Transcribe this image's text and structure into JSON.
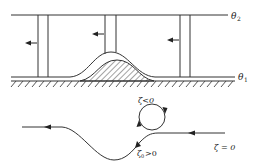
{
  "diagram": {
    "colors": {
      "line": "#333333",
      "background": "#ffffff"
    },
    "isentropes": [
      {
        "id": "theta2",
        "label": "θ",
        "subscript": "2"
      },
      {
        "id": "theta1",
        "label": "θ",
        "subscript": "1"
      }
    ],
    "flow_direction": "right-to-left",
    "trajectory_labels": {
      "loop": "ζ<0",
      "upstream": "ζ = 0",
      "lee_sym": "ζ",
      "lee_sub": "0",
      "lee_rel": ">0"
    }
  }
}
